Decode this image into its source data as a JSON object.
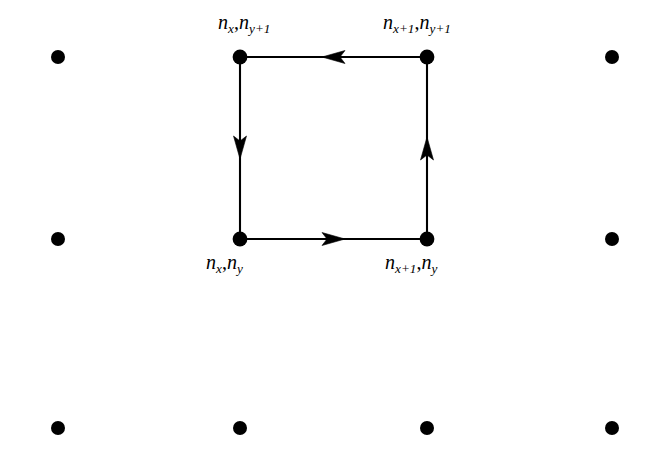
{
  "figure": {
    "name": "lattice-plaquette-with-directed-loop",
    "background_color": "#ffffff",
    "ink_color": "#000000",
    "width": 652,
    "height": 449
  },
  "lattice": {
    "dot_color": "#000000",
    "dot_radius": 7,
    "columns_x": [
      58,
      240,
      427,
      612
    ],
    "rows_y": [
      57,
      239,
      428
    ],
    "dots": [
      {
        "name": "dot-r1-c1",
        "x": 58,
        "y": 57,
        "on_loop": false
      },
      {
        "name": "dot-r1-c2",
        "x": 240,
        "y": 57,
        "on_loop": true
      },
      {
        "name": "dot-r1-c3",
        "x": 427,
        "y": 57,
        "on_loop": true
      },
      {
        "name": "dot-r1-c4",
        "x": 612,
        "y": 57,
        "on_loop": false
      },
      {
        "name": "dot-r2-c1",
        "x": 58,
        "y": 239,
        "on_loop": false
      },
      {
        "name": "dot-r2-c2",
        "x": 240,
        "y": 239,
        "on_loop": true
      },
      {
        "name": "dot-r2-c3",
        "x": 427,
        "y": 239,
        "on_loop": true
      },
      {
        "name": "dot-r2-c4",
        "x": 612,
        "y": 239,
        "on_loop": false
      },
      {
        "name": "dot-r3-c1",
        "x": 58,
        "y": 428,
        "on_loop": false
      },
      {
        "name": "dot-r3-c2",
        "x": 240,
        "y": 428,
        "on_loop": false
      },
      {
        "name": "dot-r3-c3",
        "x": 427,
        "y": 428,
        "on_loop": false
      },
      {
        "name": "dot-r3-c4",
        "x": 612,
        "y": 428,
        "on_loop": false
      }
    ]
  },
  "loop": {
    "stroke_color": "#000000",
    "stroke_width": 2.1,
    "orientation": "counterclockwise",
    "edges": [
      {
        "name": "edge-bottom",
        "from": "dot-r2-c2",
        "to": "dot-r2-c3",
        "x1": 240,
        "y1": 239,
        "x2": 427,
        "y2": 239,
        "direction": "right",
        "arrow_x": 334,
        "arrow_y": 239
      },
      {
        "name": "edge-right",
        "from": "dot-r2-c3",
        "to": "dot-r1-c3",
        "x1": 427,
        "y1": 239,
        "x2": 427,
        "y2": 57,
        "direction": "up",
        "arrow_x": 427,
        "arrow_y": 148
      },
      {
        "name": "edge-top",
        "from": "dot-r1-c3",
        "to": "dot-r1-c2",
        "x1": 427,
        "y1": 57,
        "x2": 240,
        "y2": 57,
        "direction": "left",
        "arrow_x": 334,
        "arrow_y": 57
      },
      {
        "name": "edge-left",
        "from": "dot-r1-c2",
        "to": "dot-r2-c2",
        "x1": 240,
        "y1": 57,
        "x2": 240,
        "y2": 239,
        "direction": "down",
        "arrow_x": 240,
        "arrow_y": 148
      }
    ]
  },
  "labels": {
    "top_left": {
      "name": "label-nx-ny-plus-1",
      "var1": "n",
      "sub1": "x",
      "comma": ",",
      "var2": "n",
      "sub2": "y+1",
      "plain": "n_x , n_y+1"
    },
    "top_right": {
      "name": "label-nx-plus-1-ny-plus-1",
      "var1": "n",
      "sub1": "x+1",
      "comma": ",",
      "var2": "n",
      "sub2": "y+1",
      "plain": "n_x+1 , n_y+1"
    },
    "bottom_left": {
      "name": "label-nx-ny",
      "var1": "n",
      "sub1": "x",
      "comma": ",",
      "var2": "n",
      "sub2": "y",
      "plain": "n_x , n_y"
    },
    "bottom_right": {
      "name": "label-nx-plus-1-ny",
      "var1": "n",
      "sub1": "x+1",
      "comma": ",",
      "var2": "n",
      "sub2": "y",
      "plain": "n_x+1 , n_y"
    }
  }
}
